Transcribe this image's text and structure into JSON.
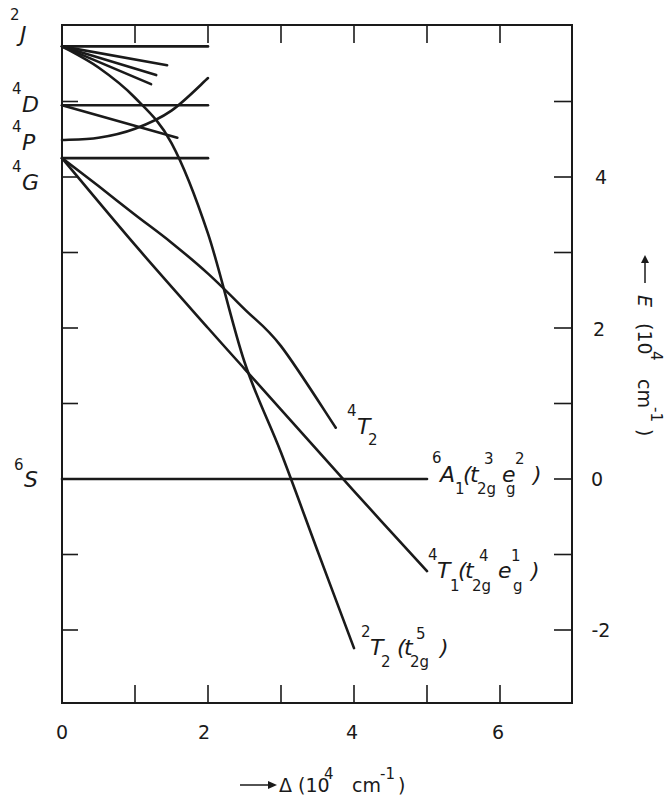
{
  "chart_data": {
    "type": "line",
    "title": "",
    "xlabel": "Δ (10^4 cm^-1)",
    "ylabel": "E (10^4 cm^-1)",
    "xlim": [
      0,
      7
    ],
    "ylim": [
      -2.9,
      6.0
    ],
    "grid": false,
    "x_ticks": [
      0,
      1,
      2,
      3,
      4,
      5,
      6
    ],
    "x_tick_labels": [
      {
        "value": 0,
        "label": "0"
      },
      {
        "value": 2,
        "label": "2"
      },
      {
        "value": 4,
        "label": "4"
      },
      {
        "value": 6,
        "label": "6"
      }
    ],
    "y_ticks": [
      -2,
      -1,
      0,
      1,
      2,
      3,
      4,
      5
    ],
    "y_tick_labels": [
      {
        "value": 4,
        "label": "4"
      },
      {
        "value": 2,
        "label": "2"
      },
      {
        "value": 0,
        "label": "0"
      },
      {
        "value": -2,
        "label": "-2"
      }
    ],
    "free_ion_levels": [
      {
        "term": "2J",
        "spin": "2",
        "letter": "J",
        "E": 5.73
      },
      {
        "term": "4D",
        "spin": "4",
        "letter": "D",
        "E": 4.95
      },
      {
        "term": "4P",
        "spin": "4",
        "letter": "P",
        "E": 4.49
      },
      {
        "term": "4G",
        "spin": "4",
        "letter": "G",
        "E": 4.25
      },
      {
        "term": "6S",
        "spin": "6",
        "letter": "S",
        "E": 0.0
      }
    ],
    "series": [
      {
        "name": "2J level",
        "x": [
          0,
          2.0
        ],
        "y": [
          5.73,
          5.73
        ]
      },
      {
        "name": "4D level",
        "x": [
          0,
          2.0
        ],
        "y": [
          4.95,
          4.95
        ]
      },
      {
        "name": "4G level",
        "x": [
          0,
          2.0
        ],
        "y": [
          4.25,
          4.25
        ]
      },
      {
        "name": "2J fan a",
        "x": [
          0,
          1.44
        ],
        "y": [
          5.73,
          5.48
        ]
      },
      {
        "name": "2J fan b",
        "x": [
          0,
          1.29
        ],
        "y": [
          5.73,
          5.35
        ]
      },
      {
        "name": "2J fan c",
        "x": [
          0,
          1.22
        ],
        "y": [
          5.73,
          5.23
        ]
      },
      {
        "name": "4D branch",
        "x": [
          0,
          1.58
        ],
        "y": [
          4.95,
          4.52
        ]
      },
      {
        "name": "4P branch",
        "x": [
          0,
          0.5,
          1.0,
          1.5,
          2.0
        ],
        "y": [
          4.49,
          4.52,
          4.64,
          4.88,
          5.31
        ]
      },
      {
        "name": "4T2",
        "label": "4T2",
        "x": [
          0,
          0.5,
          1.0,
          1.5,
          2.0,
          2.5,
          3.0,
          3.75
        ],
        "y": [
          4.25,
          3.88,
          3.5,
          3.13,
          2.72,
          2.25,
          1.76,
          0.68
        ]
      },
      {
        "name": "4T1(t2g4 eg1)",
        "label": "4T1(t2g4 eg1)",
        "x": [
          0,
          1.0,
          2.0,
          2.5,
          3.0,
          4.0,
          5.0
        ],
        "y": [
          4.25,
          3.1,
          2.0,
          1.46,
          0.92,
          -0.16,
          -1.22
        ]
      },
      {
        "name": "2T2(t2g5)",
        "label": "2T2(t2g5)",
        "x": [
          0,
          0.5,
          1.0,
          1.5,
          2.0,
          2.5,
          3.0,
          3.5,
          4.0
        ],
        "y": [
          5.73,
          5.45,
          5.05,
          4.45,
          3.25,
          1.55,
          0.35,
          -0.95,
          -2.24
        ]
      },
      {
        "name": "6A1(t2g3 eg2)",
        "label": "6A1(t2g3 eg2)",
        "x": [
          0,
          5.0
        ],
        "y": [
          0,
          0
        ]
      }
    ],
    "curve_labels": {
      "4T2": {
        "spin": "4",
        "letter": "T",
        "sub": "2",
        "config": ""
      },
      "6A1": {
        "spin": "6",
        "letter": "A",
        "sub": "1",
        "config": "(t2g3 eg2)"
      },
      "4T1": {
        "spin": "4",
        "letter": "T",
        "sub": "1",
        "config": "(t2g4 eg1)"
      },
      "2T2": {
        "spin": "2",
        "letter": "T",
        "sub": "2",
        "config": "(t2g5)"
      }
    }
  },
  "axis_titles": {
    "x": {
      "arrow": "→",
      "symbol": "Δ",
      "text": "(10",
      "exp": "4",
      "unit": "cm",
      "unit_exp": "-1",
      "close": ")"
    },
    "y": {
      "arrow": "→",
      "symbol": "E",
      "text": "(10",
      "exp": "4",
      "unit": "cm",
      "unit_exp": "-1",
      "close": ")"
    }
  },
  "text": {
    "t": "t",
    "e": "e",
    "open": "(",
    "close": ")",
    "twog": "2g",
    "g": "g",
    "n1": "1",
    "n2": "2",
    "n3": "3",
    "n4": "4",
    "n5": "5"
  },
  "colors": {
    "ink": "#1a1a1a",
    "background": "#ffffff"
  }
}
